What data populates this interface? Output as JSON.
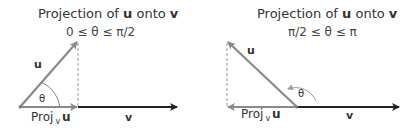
{
  "left": {
    "title_pre": "Projection of ",
    "title_u": "u",
    "title_mid": " onto ",
    "title_v": "v",
    "range": "0 ≤ θ ≤ π/2",
    "u_label": "u",
    "theta_label": "θ",
    "proj_label": "Proj",
    "proj_sub": "v",
    "proj_u": "u",
    "v_label": "v"
  },
  "right": {
    "title_pre": "Projection of ",
    "title_u": "u",
    "title_mid": " onto ",
    "title_v": "v",
    "range": "π/2 ≤ θ ≤ π",
    "u_label": "u",
    "theta_label": "θ",
    "proj_label": "Proj",
    "proj_sub": "v",
    "proj_u": "u",
    "v_label": "v"
  },
  "colors": {
    "gray_vector": "#8a8a8a",
    "dark_vector": "#222222"
  }
}
